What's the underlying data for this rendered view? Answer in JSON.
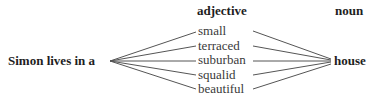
{
  "diagram": {
    "headers": {
      "adjective": "adjective",
      "noun": "noun"
    },
    "subject_phrase": "Simon lives in a",
    "adjectives": [
      "small",
      "terraced",
      "suburban",
      "squalid",
      "beautiful"
    ],
    "noun": "house",
    "colors": {
      "text": "#1e1e1e",
      "adjective_text": "#3a3a3a",
      "lines": "#555555"
    }
  }
}
